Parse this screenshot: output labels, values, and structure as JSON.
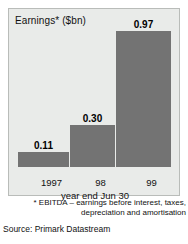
{
  "chart_data": {
    "type": "bar",
    "title": "Earnings* ($bn)",
    "categories": [
      "1997",
      "98",
      "99"
    ],
    "values": [
      0.11,
      0.3,
      0.97
    ],
    "value_labels": [
      "0.11",
      "0.30",
      "0.97"
    ],
    "xlabel": "year end Jun 30",
    "ylabel": "",
    "ylim": [
      0,
      1.13
    ],
    "grid": false,
    "legend": null,
    "bar_color": "#737373",
    "panel_background": "#e9ebe9",
    "annotations": [
      "* EBITDA – earnings before interest, taxes,",
      "depreciation and amortisation"
    ],
    "source": "Source: Primark Datastream"
  },
  "panel": {
    "title": "Earnings* ($bn)"
  },
  "axis": {
    "x_title": "year end Jun 30",
    "ticks": [
      "1997",
      "98",
      "99"
    ]
  },
  "bars": [
    {
      "label": "1997",
      "value_label": "0.11"
    },
    {
      "label": "98",
      "value_label": "0.30"
    },
    {
      "label": "99",
      "value_label": "0.97"
    }
  ],
  "footnote": {
    "line1": "* EBITDA – earnings before interest, taxes,",
    "line2": "depreciation and amortisation"
  },
  "source": {
    "text": "Source: Primark Datastream"
  }
}
